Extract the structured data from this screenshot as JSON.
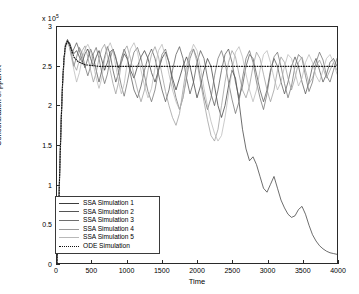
{
  "chart_data": {
    "type": "line",
    "title": "",
    "xlabel": "Time",
    "ylabel": "Concentration of ppERK",
    "y_exponent_label": "x 10",
    "y_exponent_power": "5",
    "xlim": [
      0,
      4000
    ],
    "ylim": [
      0,
      3
    ],
    "grid": false,
    "legend_position": "lower-left",
    "xticks": [
      "0",
      "500",
      "1000",
      "1500",
      "2000",
      "2500",
      "3000",
      "3500",
      "4000"
    ],
    "yticks": [
      "0",
      "0.5",
      "1",
      "1.5",
      "2",
      "2.5",
      "3"
    ],
    "series": [
      {
        "name": "SSA Simulation 1",
        "color": "#3c3c3c",
        "style": "solid",
        "x": [
          0,
          20,
          40,
          60,
          80,
          100,
          120,
          150,
          180,
          210,
          240,
          280,
          320,
          360,
          400,
          440,
          480,
          520,
          560,
          600,
          640,
          680,
          720,
          760,
          800,
          840,
          880,
          920,
          960,
          1000,
          1050,
          1100,
          1150,
          1200,
          1250,
          1300,
          1350,
          1400,
          1450,
          1500,
          1550,
          1600,
          1650,
          1700,
          1750,
          1800,
          1850,
          1900,
          1950,
          2000,
          2050,
          2100,
          2150,
          2200,
          2250,
          2300,
          2350,
          2400,
          2450,
          2500,
          2550,
          2600,
          2650,
          2700,
          2750,
          2800,
          2850,
          2900,
          2950,
          3000,
          3050,
          3100,
          3150,
          3200,
          3250,
          3300,
          3350,
          3400,
          3450,
          3500,
          3550,
          3600,
          3650,
          3700,
          3750,
          3800,
          3850,
          3900,
          3950,
          4000
        ],
        "y": [
          0,
          0.55,
          1.25,
          1.85,
          2.3,
          2.6,
          2.75,
          2.82,
          2.8,
          2.72,
          2.66,
          2.7,
          2.62,
          2.55,
          2.66,
          2.72,
          2.6,
          2.5,
          2.62,
          2.7,
          2.58,
          2.45,
          2.55,
          2.68,
          2.72,
          2.6,
          2.48,
          2.55,
          2.66,
          2.6,
          2.45,
          2.35,
          2.5,
          2.62,
          2.7,
          2.6,
          2.42,
          2.3,
          2.45,
          2.6,
          2.68,
          2.55,
          2.35,
          2.2,
          2.35,
          2.5,
          2.62,
          2.5,
          2.3,
          2.1,
          2.25,
          2.45,
          2.6,
          2.5,
          2.25,
          2.0,
          1.85,
          2.0,
          2.25,
          2.45,
          2.35,
          2.05,
          1.7,
          1.45,
          1.3,
          1.35,
          1.25,
          1.1,
          0.95,
          0.9,
          1.0,
          1.1,
          0.95,
          0.8,
          0.7,
          0.62,
          0.58,
          0.6,
          0.68,
          0.72,
          0.62,
          0.48,
          0.36,
          0.28,
          0.22,
          0.18,
          0.15,
          0.13,
          0.12,
          0.11
        ]
      },
      {
        "name": "SSA Simulation 2",
        "color": "#555555",
        "style": "solid",
        "x": [
          0,
          20,
          40,
          60,
          80,
          100,
          120,
          150,
          180,
          210,
          240,
          280,
          320,
          360,
          400,
          440,
          480,
          520,
          560,
          600,
          640,
          680,
          720,
          760,
          800,
          840,
          880,
          920,
          960,
          1000,
          1050,
          1100,
          1150,
          1200,
          1250,
          1300,
          1350,
          1400,
          1450,
          1500,
          1550,
          1600,
          1650,
          1700,
          1750,
          1800,
          1850,
          1900,
          1950,
          2000,
          2050,
          2100,
          2150,
          2200,
          2250,
          2300,
          2350,
          2400,
          2450,
          2500,
          2550,
          2600,
          2650,
          2700,
          2750,
          2800,
          2850,
          2900,
          2950,
          3000,
          3050,
          3100,
          3150,
          3200,
          3250,
          3300,
          3350,
          3400,
          3450,
          3500,
          3550,
          3600,
          3650,
          3700,
          3750,
          3800,
          3850,
          3900,
          3950,
          4000
        ],
        "y": [
          0,
          0.5,
          1.2,
          1.8,
          2.28,
          2.58,
          2.76,
          2.84,
          2.78,
          2.66,
          2.72,
          2.8,
          2.7,
          2.58,
          2.48,
          2.6,
          2.72,
          2.62,
          2.45,
          2.3,
          2.45,
          2.62,
          2.75,
          2.65,
          2.45,
          2.3,
          2.42,
          2.6,
          2.72,
          2.62,
          2.4,
          2.2,
          2.1,
          2.25,
          2.45,
          2.62,
          2.72,
          2.6,
          2.4,
          2.2,
          2.05,
          2.2,
          2.45,
          2.65,
          2.75,
          2.6,
          2.35,
          2.15,
          2.3,
          2.55,
          2.7,
          2.6,
          2.35,
          2.15,
          2.0,
          2.2,
          2.45,
          2.65,
          2.72,
          2.55,
          2.3,
          2.1,
          2.25,
          2.5,
          2.65,
          2.6,
          2.4,
          2.2,
          2.05,
          2.2,
          2.45,
          2.6,
          2.5,
          2.3,
          2.15,
          2.3,
          2.5,
          2.62,
          2.5,
          2.3,
          2.15,
          2.3,
          2.5,
          2.6,
          2.45,
          2.3,
          2.4,
          2.55,
          2.6,
          2.5
        ]
      },
      {
        "name": "SSA Simulation 3",
        "color": "#6e6e6e",
        "style": "solid",
        "x": [
          0,
          20,
          40,
          60,
          80,
          100,
          120,
          150,
          180,
          210,
          240,
          280,
          320,
          360,
          400,
          440,
          480,
          520,
          560,
          600,
          640,
          680,
          720,
          760,
          800,
          840,
          880,
          920,
          960,
          1000,
          1050,
          1100,
          1150,
          1200,
          1250,
          1300,
          1350,
          1400,
          1450,
          1500,
          1550,
          1600,
          1650,
          1700,
          1750,
          1800,
          1850,
          1900,
          1950,
          2000,
          2050,
          2100,
          2150,
          2200,
          2250,
          2300,
          2350,
          2400,
          2450,
          2500,
          2550,
          2600,
          2650,
          2700,
          2750,
          2800,
          2850,
          2900,
          2950,
          3000,
          3050,
          3100,
          3150,
          3200,
          3250,
          3300,
          3350,
          3400,
          3450,
          3500,
          3550,
          3600,
          3650,
          3700,
          3750,
          3800,
          3850,
          3900,
          3950,
          4000
        ],
        "y": [
          0,
          0.52,
          1.22,
          1.82,
          2.3,
          2.6,
          2.78,
          2.84,
          2.74,
          2.62,
          2.5,
          2.62,
          2.74,
          2.66,
          2.5,
          2.38,
          2.5,
          2.66,
          2.74,
          2.6,
          2.42,
          2.28,
          2.4,
          2.6,
          2.72,
          2.62,
          2.42,
          2.25,
          2.12,
          2.28,
          2.5,
          2.68,
          2.74,
          2.6,
          2.38,
          2.18,
          2.05,
          2.2,
          2.45,
          2.65,
          2.72,
          2.55,
          2.3,
          2.1,
          1.95,
          2.1,
          2.35,
          2.6,
          2.72,
          2.6,
          2.35,
          2.12,
          1.95,
          2.1,
          2.38,
          2.6,
          2.7,
          2.55,
          2.3,
          2.08,
          1.9,
          2.05,
          2.35,
          2.6,
          2.7,
          2.55,
          2.3,
          2.1,
          1.95,
          2.15,
          2.42,
          2.62,
          2.68,
          2.5,
          2.28,
          2.1,
          2.25,
          2.5,
          2.65,
          2.6,
          2.38,
          2.18,
          2.3,
          2.55,
          2.68,
          2.58,
          2.38,
          2.3,
          2.45,
          2.6
        ]
      },
      {
        "name": "SSA Simulation 4",
        "color": "#9a9a9a",
        "style": "solid",
        "x": [
          0,
          20,
          40,
          60,
          80,
          100,
          120,
          150,
          180,
          210,
          240,
          280,
          320,
          360,
          400,
          440,
          480,
          520,
          560,
          600,
          640,
          680,
          720,
          760,
          800,
          840,
          880,
          920,
          960,
          1000,
          1050,
          1100,
          1150,
          1200,
          1250,
          1300,
          1350,
          1400,
          1450,
          1500,
          1550,
          1600,
          1650,
          1700,
          1750,
          1800,
          1850,
          1900,
          1950,
          2000,
          2050,
          2100,
          2150,
          2200,
          2250,
          2300,
          2350,
          2400,
          2450,
          2500,
          2550,
          2600,
          2650,
          2700,
          2750,
          2800,
          2850,
          2900,
          2950,
          3000,
          3050,
          3100,
          3150,
          3200,
          3250,
          3300,
          3350,
          3400,
          3450,
          3500,
          3550,
          3600,
          3650,
          3700,
          3750,
          3800,
          3850,
          3900,
          3950,
          4000
        ],
        "y": [
          0,
          0.5,
          1.18,
          1.78,
          2.26,
          2.56,
          2.74,
          2.82,
          2.76,
          2.64,
          2.52,
          2.45,
          2.58,
          2.7,
          2.76,
          2.62,
          2.45,
          2.3,
          2.42,
          2.6,
          2.72,
          2.78,
          2.65,
          2.45,
          2.28,
          2.15,
          2.3,
          2.55,
          2.7,
          2.76,
          2.6,
          2.38,
          2.2,
          2.05,
          2.2,
          2.45,
          2.65,
          2.75,
          2.62,
          2.4,
          2.18,
          2.0,
          1.85,
          1.75,
          1.9,
          2.2,
          2.5,
          2.68,
          2.72,
          2.55,
          2.3,
          2.05,
          1.82,
          1.62,
          1.55,
          1.7,
          2.0,
          2.3,
          2.55,
          2.7,
          2.62,
          2.4,
          2.2,
          2.1,
          2.25,
          2.5,
          2.68,
          2.6,
          2.4,
          2.2,
          2.05,
          2.2,
          2.45,
          2.62,
          2.55,
          2.35,
          2.2,
          2.35,
          2.55,
          2.62,
          2.45,
          2.28,
          2.35,
          2.5,
          2.58,
          2.48,
          2.35,
          2.45,
          2.55,
          2.45
        ]
      },
      {
        "name": "SSA Simulation 5",
        "color": "#b8b8b8",
        "style": "solid",
        "x": [
          0,
          20,
          40,
          60,
          80,
          100,
          120,
          150,
          180,
          210,
          240,
          280,
          320,
          360,
          400,
          440,
          480,
          520,
          560,
          600,
          640,
          680,
          720,
          760,
          800,
          840,
          880,
          920,
          960,
          1000,
          1050,
          1100,
          1150,
          1200,
          1250,
          1300,
          1350,
          1400,
          1450,
          1500,
          1550,
          1600,
          1650,
          1700,
          1750,
          1800,
          1850,
          1900,
          1950,
          2000,
          2050,
          2100,
          2150,
          2200,
          2250,
          2300,
          2350,
          2400,
          2450,
          2500,
          2550,
          2600,
          2650,
          2700,
          2750,
          2800,
          2850,
          2900,
          2950,
          3000,
          3050,
          3100,
          3150,
          3200,
          3250,
          3300,
          3350,
          3400,
          3450,
          3500,
          3550,
          3600,
          3650,
          3700,
          3750,
          3800,
          3850,
          3900,
          3950,
          4000
        ],
        "y": [
          0,
          0.48,
          1.15,
          1.75,
          2.24,
          2.54,
          2.72,
          2.8,
          2.74,
          2.6,
          2.46,
          2.3,
          2.42,
          2.6,
          2.72,
          2.78,
          2.7,
          2.52,
          2.35,
          2.22,
          2.35,
          2.58,
          2.72,
          2.8,
          2.7,
          2.5,
          2.3,
          2.15,
          2.28,
          2.52,
          2.72,
          2.8,
          2.68,
          2.45,
          2.25,
          2.1,
          2.22,
          2.48,
          2.7,
          2.78,
          2.62,
          2.4,
          2.2,
          2.05,
          1.95,
          2.1,
          2.4,
          2.65,
          2.78,
          2.7,
          2.48,
          2.22,
          2.0,
          1.8,
          1.65,
          1.55,
          1.62,
          1.85,
          2.15,
          2.45,
          2.68,
          2.75,
          2.62,
          2.4,
          2.2,
          2.05,
          2.2,
          2.45,
          2.65,
          2.7,
          2.55,
          2.35,
          2.2,
          2.3,
          2.5,
          2.65,
          2.6,
          2.42,
          2.25,
          2.35,
          2.55,
          2.65,
          2.55,
          2.38,
          2.3,
          2.45,
          2.6,
          2.65,
          2.55,
          2.4
        ]
      },
      {
        "name": "ODE Simulation",
        "color": "#111111",
        "style": "dotted",
        "x": [
          0,
          20,
          40,
          60,
          80,
          100,
          120,
          150,
          180,
          210,
          240,
          300,
          400,
          600,
          800,
          1000,
          1500,
          2000,
          2500,
          3000,
          3500,
          4000
        ],
        "y": [
          0,
          0.5,
          1.2,
          1.8,
          2.3,
          2.6,
          2.76,
          2.82,
          2.78,
          2.7,
          2.62,
          2.56,
          2.52,
          2.5,
          2.5,
          2.5,
          2.5,
          2.5,
          2.5,
          2.5,
          2.5,
          2.5
        ]
      }
    ]
  },
  "legend": {
    "items": [
      {
        "label": "SSA Simulation 1"
      },
      {
        "label": "SSA Simulation 2"
      },
      {
        "label": "SSA Simulation 3"
      },
      {
        "label": "SSA Simulation 4"
      },
      {
        "label": "SSA Simulation 5"
      },
      {
        "label": "ODE Simulation"
      }
    ]
  }
}
